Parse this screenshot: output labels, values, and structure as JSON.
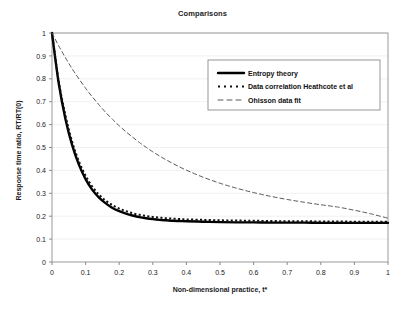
{
  "chart_data": {
    "type": "line",
    "title": "Comparisons",
    "xlabel": "Non-dimensional practice, t*",
    "ylabel": "Response time ratio, RT/RT(0)",
    "xlim": [
      0,
      1
    ],
    "ylim": [
      0,
      1
    ],
    "grid": true,
    "grid_orientation": "horizontal",
    "legend_position": "upper-right-inside",
    "xticks": [
      "0",
      "0.1",
      "0.2",
      "0.3",
      "0.4",
      "0.5",
      "0.6",
      "0.7",
      "0.8",
      "0.9",
      "1"
    ],
    "yticks": [
      "0",
      "0.1",
      "0.2",
      "0.3",
      "0.4",
      "0.5",
      "0.6",
      "0.7",
      "0.8",
      "0.9",
      "1"
    ],
    "x": [
      0,
      0.02,
      0.04,
      0.06,
      0.08,
      0.1,
      0.12,
      0.14,
      0.16,
      0.18,
      0.2,
      0.22,
      0.24,
      0.26,
      0.28,
      0.3,
      0.32,
      0.34,
      0.36,
      0.38,
      0.4,
      0.45,
      0.5,
      0.55,
      0.6,
      0.65,
      0.7,
      0.75,
      0.8,
      0.85,
      0.9,
      0.95,
      1
    ],
    "series": [
      {
        "name": "Entropy theory",
        "style": "solid",
        "color": "#000000",
        "width": 2.4,
        "values": [
          1.0,
          0.78,
          0.625,
          0.51,
          0.425,
          0.362,
          0.315,
          0.281,
          0.256,
          0.236,
          0.222,
          0.211,
          0.203,
          0.196,
          0.191,
          0.187,
          0.184,
          0.182,
          0.18,
          0.179,
          0.178,
          0.176,
          0.174,
          0.173,
          0.173,
          0.172,
          0.172,
          0.172,
          0.171,
          0.171,
          0.171,
          0.171,
          0.171
        ]
      },
      {
        "name": "Data correlation Heathcote et al",
        "style": "dotted",
        "color": "#111111",
        "width": 2.0,
        "values": [
          1.0,
          0.79,
          0.64,
          0.525,
          0.44,
          0.377,
          0.329,
          0.294,
          0.268,
          0.248,
          0.233,
          0.222,
          0.213,
          0.206,
          0.201,
          0.197,
          0.194,
          0.191,
          0.189,
          0.188,
          0.186,
          0.184,
          0.182,
          0.181,
          0.18,
          0.179,
          0.178,
          0.178,
          0.177,
          0.177,
          0.176,
          0.176,
          0.176
        ]
      },
      {
        "name": "Ohisson data fit",
        "style": "dashed",
        "color": "#595959",
        "width": 1.0,
        "values": [
          1.0,
          0.944,
          0.892,
          0.844,
          0.8,
          0.759,
          0.721,
          0.686,
          0.653,
          0.623,
          0.595,
          0.569,
          0.545,
          0.522,
          0.501,
          0.481,
          0.463,
          0.446,
          0.43,
          0.415,
          0.401,
          0.37,
          0.344,
          0.322,
          0.303,
          0.287,
          0.273,
          0.261,
          0.25,
          0.24,
          0.226,
          0.21,
          0.191
        ]
      }
    ]
  },
  "legend": {
    "items": [
      {
        "label": "Entropy theory",
        "marker": "solid-line-swatch"
      },
      {
        "label": "Data correlation Heathcote et al",
        "marker": "dotted-line-swatch"
      },
      {
        "label": "Ohisson data fit",
        "marker": "dashed-line-swatch"
      }
    ]
  }
}
